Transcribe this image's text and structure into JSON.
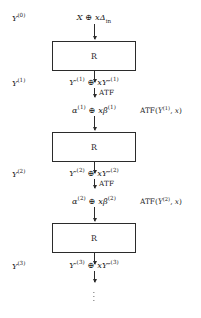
{
  "diagram": {
    "column_x": 94,
    "box_label": "R",
    "atf_label": "ATF",
    "stroke_color": "#2b2b2b",
    "background_color": "#ffffff",
    "input": {
      "base": "X",
      "operator": "⊕",
      "term": "xΔ",
      "term_subscript": "in",
      "full": "X ⊕ xΔin"
    },
    "states": [
      {
        "label": "Y",
        "superscript": "(0)",
        "full": "Y(0)"
      },
      {
        "label": "Y",
        "superscript": "(1)",
        "full": "Y(1)"
      },
      {
        "label": "Y",
        "superscript": "(2)",
        "full": "Y(2)"
      },
      {
        "label": "Y",
        "superscript": "(3)",
        "full": "Y(3)"
      }
    ],
    "rounds": [
      {
        "index": 1,
        "box_label": "R",
        "output": {
          "left_sym": "Y′",
          "left_sup": "(1)",
          "operator": "⊕",
          "right_coef": "x",
          "right_sym": "Y″",
          "right_sup": "(1)",
          "full": "Y′(1) ⊕ xY″(1)"
        },
        "transform_label": "ATF",
        "alpha_beta": {
          "alpha_sym": "α",
          "alpha_sup": "(1)",
          "operator": "⊕",
          "beta_coef": "x",
          "beta_sym": "β",
          "beta_sup": "(1)",
          "full": "α(1) ⊕ xβ(1)"
        },
        "side_note": {
          "fn": "ATF",
          "arg_sym": "Y",
          "arg_sup": "(1)",
          "arg2": "x",
          "full": "ATF(Y(1), x)"
        }
      },
      {
        "index": 2,
        "box_label": "R",
        "output": {
          "left_sym": "Y′",
          "left_sup": "(2)",
          "operator": "⊕",
          "right_coef": "x",
          "right_sym": "Y″",
          "right_sup": "(2)",
          "full": "Y′(2) ⊕ xY″(2)"
        },
        "transform_label": "ATF",
        "alpha_beta": {
          "alpha_sym": "α",
          "alpha_sup": "(2)",
          "operator": "⊕",
          "beta_coef": "x",
          "beta_sym": "β",
          "beta_sup": "(2)",
          "full": "α(2) ⊕ xβ(2)"
        },
        "side_note": {
          "fn": "ATF",
          "arg_sym": "Y",
          "arg_sup": "(2)",
          "arg2": "x",
          "full": "ATF(Y(2), x)"
        }
      },
      {
        "index": 3,
        "box_label": "R",
        "output": {
          "left_sym": "Y′",
          "left_sup": "(3)",
          "operator": "⊕",
          "right_coef": "x",
          "right_sym": "Y″",
          "right_sup": "(3)",
          "full": "Y′(3) ⊕ xY″(3)"
        }
      }
    ],
    "continuation": "⋮"
  }
}
